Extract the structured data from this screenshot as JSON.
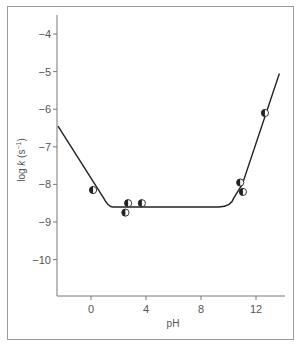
{
  "chart_data": {
    "type": "scatter",
    "title": "",
    "xlabel": "pH",
    "ylabel": "log k (s⁻¹)",
    "xlim": [
      -2.4,
      14.2
    ],
    "ylim": [
      -11.0,
      -3.5
    ],
    "xticks": [
      0,
      4,
      8,
      12
    ],
    "xtick_labels": [
      "0",
      "4",
      "8",
      "12"
    ],
    "yticks": [
      -4,
      -5,
      -6,
      -7,
      -8,
      -9,
      -10
    ],
    "ytick_labels": [
      "−4",
      "−5",
      "−6",
      "−7",
      "−8",
      "−9",
      "−10"
    ],
    "grid": false,
    "legend": null,
    "series": [
      {
        "name": "measured",
        "marker": "half-filled-circle",
        "points": [
          {
            "x": 0.15,
            "y": -8.15
          },
          {
            "x": 2.5,
            "y": -8.75
          },
          {
            "x": 2.7,
            "y": -8.5
          },
          {
            "x": 3.7,
            "y": -8.5
          },
          {
            "x": 10.85,
            "y": -7.95
          },
          {
            "x": 11.05,
            "y": -8.2
          },
          {
            "x": 12.65,
            "y": -6.1
          }
        ]
      },
      {
        "name": "fit",
        "type": "line",
        "points": [
          {
            "x": -2.4,
            "y": -6.45
          },
          {
            "x": 0.9,
            "y": -8.35
          },
          {
            "x": 1.6,
            "y": -8.6
          },
          {
            "x": 9.3,
            "y": -8.6
          },
          {
            "x": 10.4,
            "y": -8.35
          },
          {
            "x": 11.0,
            "y": -8.0
          },
          {
            "x": 13.7,
            "y": -5.05
          }
        ]
      }
    ]
  },
  "axes": {
    "x_label": "pH",
    "y_label_main": "log ",
    "y_label_var": "k",
    "y_label_unit": " (s",
    "y_label_sup": "−1",
    "y_label_close": ")"
  }
}
